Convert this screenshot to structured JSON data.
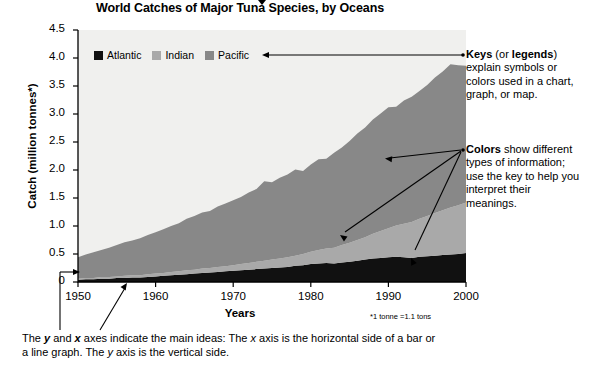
{
  "chart_data": {
    "type": "area",
    "title": "World Catches of Major Tuna Species, by Oceans",
    "xlabel": "Years",
    "ylabel": "Catch (million tonnes*)",
    "footnote": "*1 tonne =1.1 tons",
    "stacked": true,
    "legend_position": "top-left-inside",
    "grid": false,
    "xlim": [
      1950,
      2000
    ],
    "ylim": [
      0,
      4.5
    ],
    "yticks": [
      "4.5",
      "4.0",
      "3.5",
      "3.0",
      "2.5",
      "2.0",
      "1.5",
      "1.0",
      "0.5",
      "0"
    ],
    "ytick_values": [
      4.5,
      4.0,
      3.5,
      3.0,
      2.5,
      2.0,
      1.5,
      1.0,
      0.5,
      0
    ],
    "xticks": [
      "1950",
      "1960",
      "1970",
      "1980",
      "1990",
      "2000"
    ],
    "xtick_values": [
      1950,
      1960,
      1970,
      1980,
      1990,
      2000
    ],
    "x": [
      1950,
      1951,
      1952,
      1953,
      1954,
      1955,
      1956,
      1957,
      1958,
      1959,
      1960,
      1961,
      1962,
      1963,
      1964,
      1965,
      1966,
      1967,
      1968,
      1969,
      1970,
      1971,
      1972,
      1973,
      1974,
      1975,
      1976,
      1977,
      1978,
      1979,
      1980,
      1981,
      1982,
      1983,
      1984,
      1985,
      1986,
      1987,
      1988,
      1989,
      1990,
      1991,
      1992,
      1993,
      1994,
      1995,
      1996,
      1997,
      1998,
      1999,
      2000
    ],
    "series": [
      {
        "name": "Atlantic",
        "color": "#111111",
        "values": [
          0.04,
          0.05,
          0.05,
          0.06,
          0.06,
          0.07,
          0.07,
          0.08,
          0.08,
          0.09,
          0.1,
          0.11,
          0.12,
          0.13,
          0.14,
          0.15,
          0.16,
          0.17,
          0.18,
          0.19,
          0.2,
          0.21,
          0.22,
          0.23,
          0.24,
          0.25,
          0.26,
          0.27,
          0.29,
          0.3,
          0.32,
          0.33,
          0.34,
          0.33,
          0.35,
          0.36,
          0.38,
          0.4,
          0.42,
          0.43,
          0.44,
          0.45,
          0.44,
          0.43,
          0.45,
          0.46,
          0.47,
          0.48,
          0.49,
          0.5,
          0.52
        ]
      },
      {
        "name": "Indian",
        "color": "#a9a9a9",
        "values": [
          0.02,
          0.02,
          0.02,
          0.03,
          0.03,
          0.03,
          0.04,
          0.04,
          0.04,
          0.05,
          0.05,
          0.05,
          0.06,
          0.06,
          0.07,
          0.07,
          0.08,
          0.08,
          0.09,
          0.09,
          0.1,
          0.11,
          0.12,
          0.13,
          0.14,
          0.15,
          0.16,
          0.17,
          0.18,
          0.2,
          0.22,
          0.24,
          0.26,
          0.28,
          0.31,
          0.34,
          0.37,
          0.4,
          0.44,
          0.48,
          0.52,
          0.56,
          0.6,
          0.64,
          0.68,
          0.72,
          0.76,
          0.8,
          0.84,
          0.87,
          0.9
        ]
      },
      {
        "name": "Pacific",
        "color": "#888888",
        "values": [
          0.38,
          0.42,
          0.46,
          0.48,
          0.52,
          0.56,
          0.6,
          0.62,
          0.66,
          0.7,
          0.74,
          0.78,
          0.82,
          0.86,
          0.92,
          0.96,
          1.0,
          1.02,
          1.08,
          1.12,
          1.16,
          1.2,
          1.26,
          1.3,
          1.42,
          1.38,
          1.44,
          1.48,
          1.54,
          1.48,
          1.56,
          1.62,
          1.6,
          1.7,
          1.74,
          1.82,
          1.9,
          1.96,
          2.04,
          2.1,
          2.16,
          2.12,
          2.2,
          2.24,
          2.28,
          2.34,
          2.42,
          2.48,
          2.56,
          2.5,
          2.44
        ]
      }
    ]
  },
  "annotations": {
    "keys": {
      "bold1": "Keys",
      "mid": " (or ",
      "bold2": "legends",
      "rest": ") explain symbols or colors used in a chart, graph, or map."
    },
    "colors": {
      "bold1": "Colors",
      "rest": " show different types of information; use the key to help you interpret their meanings."
    },
    "caption_line1_a": "The ",
    "caption_line1_y": "y",
    "caption_line1_b": " and ",
    "caption_line1_x": "x",
    "caption_line1_c": " axes indicate the main ideas: The ",
    "caption_line1_x2": "x",
    "caption_line1_d": " axis is the horizontal side of a bar or a line graph. The ",
    "caption_line1_y2": "y",
    "caption_line1_e": " axis is the vertical side."
  },
  "colors": {
    "plot_background": "#f0f0ee",
    "axis": "#000000",
    "page_background": "#ffffff"
  }
}
